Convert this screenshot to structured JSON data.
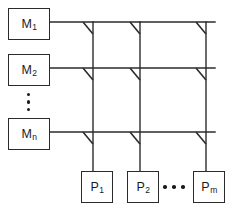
{
  "figure": {
    "caption_partial": "",
    "colors": {
      "background": "#ffffff",
      "line": "#2b2b2b",
      "box_border": "#2b2b2b",
      "text": "#1a1a1a",
      "switch": "#2b2b2b"
    }
  },
  "memory_nodes": [
    {
      "id": "M1",
      "base": "M",
      "sub": "1",
      "label": "M1",
      "x": 8,
      "y": 8,
      "w": 42,
      "h": 32
    },
    {
      "id": "M2",
      "base": "M",
      "sub": "2",
      "label": "M2",
      "x": 8,
      "y": 54,
      "w": 42,
      "h": 32
    },
    {
      "id": "Mn",
      "base": "M",
      "sub": "n",
      "label": "Mn",
      "x": 8,
      "y": 118,
      "w": 42,
      "h": 32
    }
  ],
  "memory_ellipsis": {
    "dots": 3,
    "orientation": "vertical",
    "x": 27,
    "y": 93,
    "height": 18
  },
  "processor_nodes": [
    {
      "id": "P1",
      "base": "P",
      "sub": "1",
      "label": "P1",
      "x": 81,
      "y": 171,
      "w": 32,
      "h": 32
    },
    {
      "id": "P2",
      "base": "P",
      "sub": "2",
      "label": "P2",
      "x": 127,
      "y": 171,
      "w": 32,
      "h": 32
    },
    {
      "id": "Pm",
      "base": "P",
      "sub": "m",
      "label": "Pm",
      "x": 193,
      "y": 171,
      "w": 32,
      "h": 32
    }
  ],
  "processor_ellipsis": {
    "dots": 3,
    "orientation": "horizontal",
    "x": 163,
    "y": 185,
    "width": 22
  },
  "buses": {
    "horizontal_rows": [
      {
        "id": "row-M1",
        "y": 22,
        "x1": 50,
        "x2": 215
      },
      {
        "id": "row-M2",
        "y": 68,
        "x1": 50,
        "x2": 215
      },
      {
        "id": "row-Mn",
        "y": 132,
        "x1": 50,
        "x2": 215
      }
    ],
    "vertical_columns": [
      {
        "id": "col-P1",
        "x": 93,
        "y1": 22,
        "y2": 171
      },
      {
        "id": "col-P2",
        "x": 140,
        "y1": 22,
        "y2": 171
      },
      {
        "id": "col-Pm",
        "x": 206,
        "y1": 22,
        "y2": 171
      }
    ]
  },
  "crosspoint_switches": [
    {
      "id": "sw-M1-P1",
      "row": "M1",
      "col": "P1",
      "x": 93,
      "y": 22
    },
    {
      "id": "sw-M1-P2",
      "row": "M1",
      "col": "P2",
      "x": 140,
      "y": 22
    },
    {
      "id": "sw-M1-Pm",
      "row": "M1",
      "col": "Pm",
      "x": 206,
      "y": 22
    },
    {
      "id": "sw-M2-P1",
      "row": "M2",
      "col": "P1",
      "x": 93,
      "y": 68
    },
    {
      "id": "sw-M2-P2",
      "row": "M2",
      "col": "P2",
      "x": 140,
      "y": 68
    },
    {
      "id": "sw-M2-Pm",
      "row": "M2",
      "col": "Pm",
      "x": 206,
      "y": 68
    },
    {
      "id": "sw-Mn-P1",
      "row": "Mn",
      "col": "P1",
      "x": 93,
      "y": 132
    },
    {
      "id": "sw-Mn-P2",
      "row": "Mn",
      "col": "P2",
      "x": 140,
      "y": 132
    },
    {
      "id": "sw-Mn-Pm",
      "row": "Mn",
      "col": "Pm",
      "x": 206,
      "y": 132
    }
  ],
  "switch_geometry": {
    "dx": -10,
    "dy": 12,
    "thickness": 1.4
  }
}
